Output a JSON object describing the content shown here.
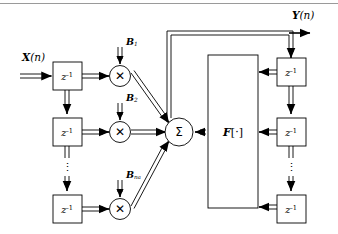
{
  "figure": {
    "type": "block-diagram",
    "stroke_color": "#000000",
    "background": "#ffffff",
    "rule_color": "#9a9a9a"
  },
  "signals": {
    "input_label": "X",
    "input_arg": "(n)",
    "output_label": "Y",
    "output_arg": "(n)"
  },
  "delay": {
    "symbol": "z",
    "exponent": "-1",
    "name": "unit-delay"
  },
  "feedforward": {
    "taps": [
      {
        "delay": "z",
        "exponent": "-1",
        "coef": "B",
        "coef_sub": "1"
      },
      {
        "delay": "z",
        "exponent": "-1",
        "coef": "B",
        "coef_sub": "2"
      },
      {
        "delay": "z",
        "exponent": "-1",
        "coef": "B",
        "coef_sub": "n",
        "coef_sub2": "a"
      }
    ],
    "ellipsis": "⋮"
  },
  "feedback": {
    "taps": [
      {
        "delay": "z",
        "exponent": "-1"
      },
      {
        "delay": "z",
        "exponent": "-1"
      },
      {
        "delay": "z",
        "exponent": "-1"
      }
    ],
    "ellipsis": "⋮"
  },
  "nodes": {
    "multiply_glyph": "✕",
    "sum_glyph": "Σ",
    "nonlinearity_label": "F",
    "nonlinearity_brackets_open": "[",
    "nonlinearity_dot": "·",
    "nonlinearity_brackets_close": "]"
  }
}
